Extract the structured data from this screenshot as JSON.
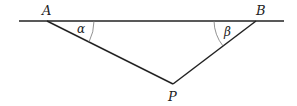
{
  "diagram": {
    "points": {
      "A": "A",
      "B": "B",
      "P": "P"
    },
    "angles": {
      "alpha": "α",
      "beta": "β"
    },
    "colors": {
      "line": "#222222",
      "arc": "#777777"
    }
  }
}
